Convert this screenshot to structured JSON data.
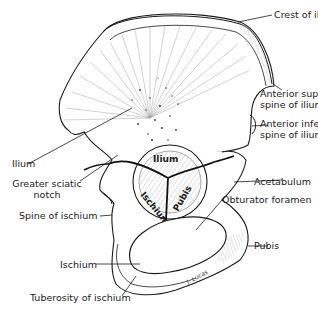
{
  "figure": {
    "type": "anatomical-illustration",
    "signature": "J. Lucas"
  },
  "labels": {
    "crest_of_ilium": "Crest of ilium",
    "anterior_superior_spine": [
      "Anterior superior",
      "spine of ilium"
    ],
    "anterior_inferior_spine": [
      "Anterior inferior",
      "spine of ilium"
    ],
    "ilium": "Ilium",
    "greater_sciatic_notch": [
      "Greater sciatic",
      "notch"
    ],
    "acetabulum": "Acetabulum",
    "obturator_foramen": "Obturator foramen",
    "spine_of_ischium": "Spine of ischium",
    "pubis": "Pubis",
    "ischium": "Ischium",
    "tuberosity_of_ischium": "Tuberosity of ischium"
  },
  "acetabulum_regions": {
    "ilium": "Ilium",
    "ischium": "Ischium",
    "pubis": "Pubis"
  },
  "colors": {
    "ink": "#1a1a1a",
    "background": "#ffffff",
    "shading": "#6b6b6b"
  }
}
